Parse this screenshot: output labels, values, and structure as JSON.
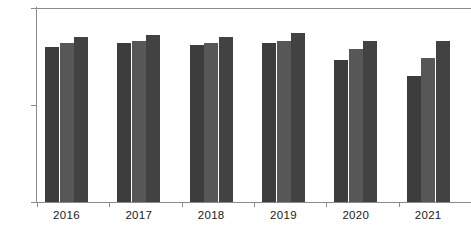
{
  "chart_data": {
    "type": "bar",
    "title": "",
    "xlabel": "",
    "ylabel": "",
    "ylim": [
      0,
      100
    ],
    "yticks": [
      0,
      50,
      100
    ],
    "ytick_labels": [
      "0",
      "50",
      "100"
    ],
    "grid": false,
    "legend": "none",
    "categories": [
      "2016",
      "2017",
      "2018",
      "2019",
      "2020",
      "2021"
    ],
    "series": [
      {
        "name": "Series 1",
        "color": "#3d3d3d",
        "values": [
          80,
          82,
          81,
          82,
          73,
          65
        ]
      },
      {
        "name": "Series 2",
        "color": "#575757",
        "values": [
          82,
          83,
          82,
          83,
          79,
          74
        ]
      },
      {
        "name": "Series 3",
        "color": "#424242",
        "values": [
          85,
          86,
          85,
          87,
          83,
          83
        ]
      }
    ]
  },
  "axes": {
    "y_max_label": "100",
    "y_mid_label": "50",
    "y_min_label": "0"
  }
}
